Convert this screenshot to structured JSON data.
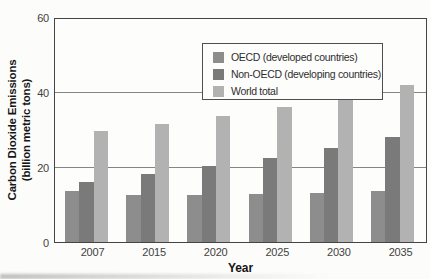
{
  "chart_data": {
    "type": "bar",
    "title": "",
    "xlabel": "Year",
    "ylabel": "Carbon Dioxide Emissions (billion metric tons)",
    "ylabel_lines": [
      "Carbon Dioxide Emissions",
      "(billion metric tons)"
    ],
    "categories": [
      "2007",
      "2015",
      "2020",
      "2025",
      "2030",
      "2035"
    ],
    "series": [
      {
        "name": "OECD (developed countries)",
        "color": "#8d8d8d",
        "values": [
          13.7,
          12.7,
          12.7,
          13.0,
          13.3,
          13.6
        ]
      },
      {
        "name": "Non-OECD (developing countries)",
        "color": "#7a7a7a",
        "values": [
          16.2,
          18.3,
          20.4,
          22.5,
          25.2,
          28.2
        ]
      },
      {
        "name": "World total",
        "color": "#b2b2b2",
        "values": [
          30.0,
          31.7,
          34.0,
          36.4,
          39.2,
          42.3
        ]
      }
    ],
    "ylim": [
      0,
      60
    ],
    "yticks": [
      0,
      20,
      40,
      60
    ],
    "grid": "horizontal",
    "legend_position": "top-center-inside",
    "frame_color": "#454545",
    "grid_color": "#858585",
    "tick_text_color": "#424242"
  }
}
